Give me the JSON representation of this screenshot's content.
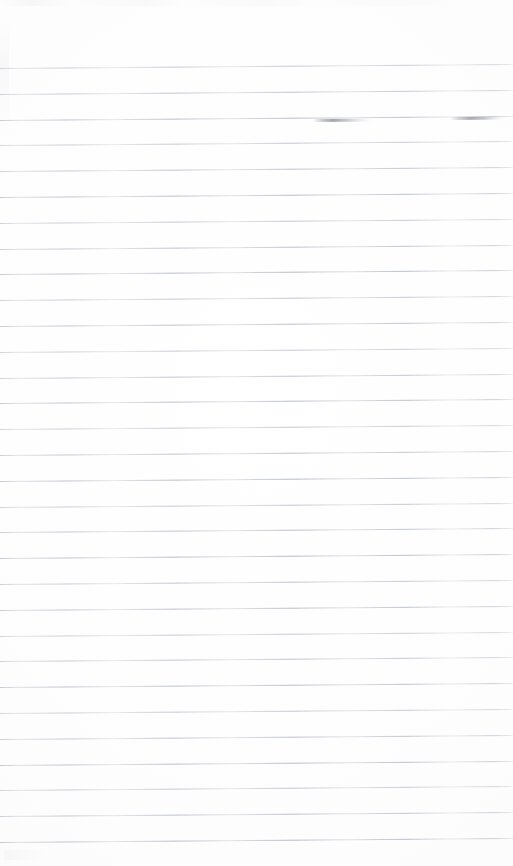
{
  "document": {
    "kind": "scanned-ruled-paper",
    "title": "Blank Ruled Notebook Page",
    "page_width": 513,
    "page_height": 866,
    "background_color": "#fefefe",
    "has_visible_text": false,
    "has_header": false,
    "has_margin_rule": false,
    "orientation": "portrait"
  },
  "ruling": {
    "style": "wide-ruled horizontal lines",
    "line_color": "#aab1c0",
    "line_thickness_px": 1,
    "line_count": 31,
    "line_spacing_px": 25.8,
    "first_line_y": 68,
    "last_line_y": 842,
    "top_margin_px": 68,
    "bottom_margin_px": 24,
    "left_inset_px": 0,
    "right_inset_px": 0,
    "slope_px_across_page": -4,
    "lines_y": [
      68,
      93.8,
      119.6,
      145.4,
      171.2,
      197,
      222.8,
      248.6,
      274.4,
      300.2,
      326,
      351.8,
      377.6,
      403.4,
      429.2,
      455,
      480.8,
      506.6,
      532.4,
      558.2,
      584,
      609.8,
      635.6,
      661.4,
      687.2,
      713,
      738.8,
      764.6,
      790.4,
      816.2,
      842
    ]
  },
  "marks": [
    {
      "id": "smudge-left",
      "description": "faint gray pen stroke smudge on third rule",
      "x": 313,
      "y": 119,
      "width": 58,
      "color": "#6c7078"
    },
    {
      "id": "smudge-right",
      "description": "faint gray pen stroke smudge on third rule near right edge",
      "x": 450,
      "y": 117,
      "width": 52,
      "color": "#6e7278"
    }
  ]
}
